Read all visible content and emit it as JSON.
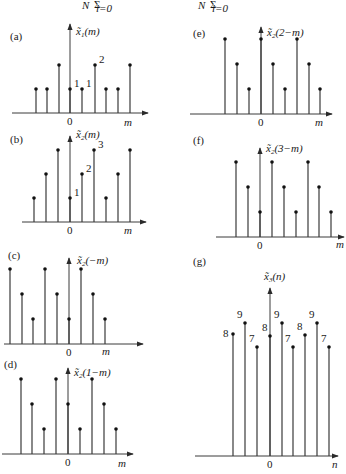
{
  "header_formula": {
    "text": "N Σ_{l=0} ( ... )   N Σ_{l=0} [ ... ]",
    "partially_visible": true
  },
  "chart_data": [
    {
      "id": "a",
      "panel_label": "(a)",
      "type": "stem",
      "title": "x̃1(m)",
      "xlabel": "m",
      "origin_label": "0",
      "x_index": [
        -3,
        -2,
        -1,
        0,
        1,
        2,
        3,
        4,
        5
      ],
      "values": [
        1,
        1,
        2,
        1,
        1,
        2,
        1,
        1,
        2
      ],
      "annotations": [
        {
          "text": "1",
          "at": 0
        },
        {
          "text": "1",
          "at": 1
        },
        {
          "text": "2",
          "at": 2
        }
      ],
      "layout": {
        "axis_y": 113,
        "zero_x": 70,
        "unit_y": 24,
        "xs": [
          36,
          47,
          59,
          70,
          82,
          95,
          106,
          118,
          130
        ],
        "axis_x0": 12,
        "axis_x1": 148,
        "label_x": 10,
        "label_y": 40,
        "title_x": 76,
        "title_y": 35,
        "m_x": 124,
        "m_y": 126,
        "axis_top": 24
      }
    },
    {
      "id": "b",
      "panel_label": "(b)",
      "type": "stem",
      "title": "x̃2(m)",
      "xlabel": "m",
      "origin_label": "0",
      "x_index": [
        -3,
        -2,
        -1,
        0,
        1,
        2,
        3,
        4,
        5
      ],
      "values": [
        1,
        2,
        3,
        1,
        2,
        3,
        1,
        2,
        3
      ],
      "annotations": [
        {
          "text": "1",
          "at": 0
        },
        {
          "text": "2",
          "at": 1
        },
        {
          "text": "3",
          "at": 2
        }
      ],
      "layout": {
        "axis_y": 222,
        "zero_x": 70,
        "unit_y": 24,
        "xs": [
          34,
          46,
          58,
          70,
          82,
          94,
          106,
          118,
          130
        ],
        "axis_x0": 22,
        "axis_x1": 146,
        "label_x": 10,
        "label_y": 143,
        "title_x": 76,
        "title_y": 138,
        "m_x": 124,
        "m_y": 234,
        "axis_top": 136
      }
    },
    {
      "id": "c",
      "panel_label": "(c)",
      "type": "stem",
      "title": "x̃2(−m)",
      "xlabel": "m",
      "origin_label": "0",
      "x_index": [
        -5,
        -4,
        -3,
        -2,
        -1,
        0,
        1,
        2,
        3
      ],
      "values": [
        3,
        2,
        1,
        3,
        2,
        1,
        3,
        2,
        1
      ],
      "annotations": [],
      "layout": {
        "axis_y": 344,
        "zero_x": 69,
        "unit_y": 25,
        "xs": [
          10,
          22,
          33,
          45,
          57,
          69,
          81,
          93,
          105
        ],
        "axis_x0": 4,
        "axis_x1": 143,
        "label_x": 8,
        "label_y": 259,
        "title_x": 77,
        "title_y": 264,
        "m_x": 102,
        "m_y": 355,
        "axis_top": 258
      }
    },
    {
      "id": "d",
      "panel_label": "(d)",
      "type": "stem",
      "title": "x̃2(1−m)",
      "xlabel": "m",
      "origin_label": "0",
      "x_index": [
        -4,
        -3,
        -2,
        -1,
        0,
        1,
        2,
        3,
        4
      ],
      "values": [
        3,
        2,
        1,
        3,
        2,
        1,
        3,
        2,
        1
      ],
      "annotations": [],
      "layout": {
        "axis_y": 454,
        "zero_x": 68,
        "unit_y": 25,
        "xs": [
          21,
          32,
          44,
          56,
          68,
          80,
          92,
          104,
          116
        ],
        "axis_x0": 2,
        "axis_x1": 133,
        "label_x": 4,
        "label_y": 368,
        "title_x": 74,
        "title_y": 376,
        "m_x": 118,
        "m_y": 467,
        "axis_top": 368
      }
    },
    {
      "id": "e",
      "panel_label": "(e)",
      "type": "stem",
      "title": "x̃2(2−m)",
      "xlabel": "m",
      "origin_label": "0",
      "x_index": [
        -3,
        -2,
        -1,
        0,
        1,
        2,
        3,
        4,
        5
      ],
      "values": [
        3,
        2,
        1,
        3,
        2,
        1,
        3,
        2,
        1
      ],
      "annotations": [],
      "layout": {
        "axis_y": 114,
        "zero_x": 261,
        "unit_y": 25,
        "xs": [
          225,
          237,
          249,
          261,
          273,
          285,
          297,
          309,
          320
        ],
        "axis_x0": 190,
        "axis_x1": 332,
        "label_x": 193,
        "label_y": 37,
        "title_x": 267,
        "title_y": 36,
        "m_x": 315,
        "m_y": 126,
        "axis_top": 27
      }
    },
    {
      "id": "f",
      "panel_label": "(f)",
      "type": "stem",
      "title": "x̃2(3−m)",
      "xlabel": "m",
      "origin_label": "0",
      "x_index": [
        -2,
        -1,
        0,
        1,
        2,
        3,
        4,
        5,
        6
      ],
      "values": [
        3,
        2,
        1,
        3,
        2,
        1,
        3,
        2,
        1
      ],
      "annotations": [],
      "layout": {
        "axis_y": 237,
        "zero_x": 260,
        "unit_y": 25,
        "xs": [
          236,
          248,
          260,
          272,
          284,
          296,
          308,
          319,
          331
        ],
        "axis_x0": 216,
        "axis_x1": 344,
        "label_x": 193,
        "label_y": 144,
        "title_x": 266,
        "title_y": 152,
        "m_x": 336,
        "m_y": 248,
        "axis_top": 148
      }
    },
    {
      "id": "g",
      "panel_label": "(g)",
      "type": "stem",
      "title": "x̃3(n)",
      "xlabel": "n",
      "origin_label": "0",
      "x_index": [
        -3,
        -2,
        -1,
        0,
        1,
        2,
        3,
        4,
        5
      ],
      "values": [
        8,
        9,
        7,
        8,
        9,
        7,
        8,
        9,
        7
      ],
      "annotations": [
        {
          "text": "8",
          "at": -3
        },
        {
          "text": "9",
          "at": -2
        },
        {
          "text": "7",
          "at": -1
        },
        {
          "text": "8",
          "at": 0
        },
        {
          "text": "9",
          "at": 1
        },
        {
          "text": "7",
          "at": 2
        },
        {
          "text": "8",
          "at": 3
        },
        {
          "text": "9",
          "at": 4
        },
        {
          "text": "7",
          "at": 5
        }
      ],
      "layout": {
        "axis_y": 456,
        "zero_x": 270,
        "xs": [
          233,
          245,
          257,
          270,
          282,
          293,
          305,
          317,
          329
        ],
        "tops": [
          334,
          323,
          347,
          336,
          323,
          347,
          335,
          323,
          347
        ],
        "axis_x0": 195,
        "axis_x1": 338,
        "label_x": 193,
        "label_y": 265,
        "title_x": 264,
        "title_y": 280,
        "m_x": 332,
        "m_y": 468,
        "axis_top": 288
      }
    }
  ]
}
